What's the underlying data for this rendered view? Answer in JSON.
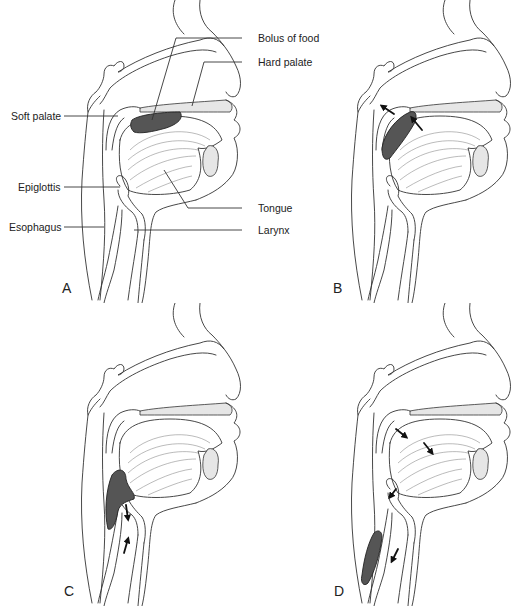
{
  "figure": {
    "panels": [
      {
        "id": "A",
        "letter": "A",
        "bolus_position": "oral cavity, on tongue under hard palate"
      },
      {
        "id": "B",
        "letter": "B",
        "bolus_position": "pushed back against soft palate into pharynx",
        "arrows": 2
      },
      {
        "id": "C",
        "letter": "C",
        "bolus_position": "pharynx above epiglottis",
        "arrows": 2
      },
      {
        "id": "D",
        "letter": "D",
        "bolus_position": "esophagus",
        "arrows": 4
      }
    ],
    "labels": {
      "bolus": "Bolus of food",
      "hard_palate": "Hard palate",
      "soft_palate": "Soft palate",
      "tongue": "Tongue",
      "epiglottis": "Epiglottis",
      "larynx": "Larynx",
      "esophagus": "Esophagus"
    },
    "colors": {
      "line": "#333333",
      "bolus": "#555555",
      "bone": "#e6e6e6",
      "background": "#ffffff"
    }
  }
}
